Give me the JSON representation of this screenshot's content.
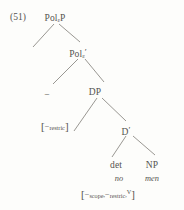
{
  "figure": {
    "example_number": "(51)",
    "type": "syntax-tree",
    "caption": ""
  },
  "tree": {
    "nodes": [
      {
        "id": "polp",
        "label": "Pol",
        "subscript": "ε",
        "suffix": "P",
        "x": 55,
        "y": 14
      },
      {
        "id": "polbar",
        "label": "Pol",
        "subscript": "ε",
        "suffix": "′",
        "x": 78,
        "y": 48
      },
      {
        "id": "minus",
        "label": "−",
        "subscript": "",
        "suffix": "",
        "x": 47,
        "y": 90
      },
      {
        "id": "dp",
        "label": "DP",
        "subscript": "",
        "suffix": "",
        "x": 95,
        "y": 88
      },
      {
        "id": "dbar",
        "label": "D",
        "subscript": "",
        "suffix": "′",
        "x": 126,
        "y": 126
      },
      {
        "id": "det",
        "label": "det",
        "subscript": "",
        "suffix": "",
        "x": 116,
        "y": 161
      },
      {
        "id": "np",
        "label": "NP",
        "subscript": "",
        "suffix": "",
        "x": 152,
        "y": 161
      }
    ],
    "leaves": [
      {
        "id": "det-word",
        "text": "no",
        "x": 119,
        "y": 174
      },
      {
        "id": "np-word",
        "text": "men",
        "x": 152,
        "y": 174
      }
    ],
    "annotations": [
      {
        "id": "dp-trace-features",
        "open": "[",
        "parts": [
          {
            "sign": "−",
            "name": "restric",
            "kind": "sub"
          }
        ],
        "close": "]",
        "x": 41,
        "y": 121
      },
      {
        "id": "det-features",
        "open": "[",
        "parts": [
          {
            "sign": "−",
            "name": "scope",
            "kind": "sub"
          },
          {
            "sign": "−",
            "name": "restric",
            "kind": "sub"
          },
          {
            "sign": "",
            "name": "V",
            "kind": "sup"
          }
        ],
        "close": "]",
        "x": 81,
        "y": 189
      }
    ],
    "edges": [
      {
        "id": "polp-left",
        "x1": 54,
        "y1": 24,
        "x2": 33,
        "y2": 47
      },
      {
        "id": "polp-right",
        "x1": 59,
        "y1": 24,
        "x2": 80,
        "y2": 42
      },
      {
        "id": "polbar-left",
        "x1": 78,
        "y1": 59,
        "x2": 53,
        "y2": 84
      },
      {
        "id": "polbar-right",
        "x1": 85,
        "y1": 59,
        "x2": 104,
        "y2": 82
      },
      {
        "id": "dp-left",
        "x1": 97,
        "y1": 98,
        "x2": 74,
        "y2": 131
      },
      {
        "id": "dp-right",
        "x1": 102,
        "y1": 98,
        "x2": 126,
        "y2": 121
      },
      {
        "id": "dbar-left",
        "x1": 126,
        "y1": 136,
        "x2": 112,
        "y2": 157
      },
      {
        "id": "dbar-right",
        "x1": 133,
        "y1": 136,
        "x2": 155,
        "y2": 155
      }
    ]
  },
  "colors": {
    "background": "#fdfdfb",
    "ink": "#55534f",
    "line": "#8d8b86"
  }
}
